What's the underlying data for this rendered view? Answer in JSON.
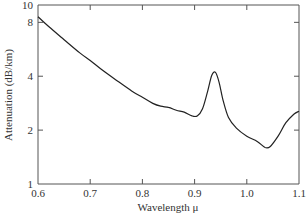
{
  "chart_data": {
    "type": "line",
    "title": "",
    "xlabel": "Wavelength μ",
    "ylabel": "Attenuation (dB/km)",
    "xlim": [
      0.6,
      1.1
    ],
    "ylim": [
      1,
      10
    ],
    "yscale": "log",
    "grid": false,
    "legend": null,
    "x_ticks": [
      0.6,
      0.7,
      0.8,
      0.9,
      1.0,
      1.1
    ],
    "x_tick_labels": [
      "0.6",
      "0.7",
      "0.8",
      "0.9",
      "1.0",
      "1.1"
    ],
    "y_ticks": [
      1,
      2,
      4,
      8,
      10
    ],
    "y_tick_labels": [
      "1",
      "2",
      "4",
      "8",
      "10"
    ],
    "series": [
      {
        "name": "Attenuation",
        "color": "#222222",
        "x": [
          0.6,
          0.62,
          0.65,
          0.68,
          0.7,
          0.72,
          0.75,
          0.78,
          0.8,
          0.82,
          0.835,
          0.85,
          0.865,
          0.88,
          0.895,
          0.905,
          0.915,
          0.925,
          0.933,
          0.94,
          0.947,
          0.955,
          0.965,
          0.98,
          1.0,
          1.02,
          1.035,
          1.045,
          1.06,
          1.075,
          1.09,
          1.1
        ],
        "y": [
          8.6,
          7.6,
          6.4,
          5.4,
          4.9,
          4.4,
          3.8,
          3.3,
          3.05,
          2.82,
          2.72,
          2.68,
          2.58,
          2.52,
          2.4,
          2.4,
          2.62,
          3.3,
          4.05,
          4.2,
          3.7,
          2.9,
          2.35,
          2.05,
          1.85,
          1.73,
          1.6,
          1.62,
          1.85,
          2.2,
          2.45,
          2.55
        ]
      }
    ]
  },
  "axes": {
    "x_label": "Wavelength μ",
    "y_label": "Attenuation (dB/km)"
  }
}
